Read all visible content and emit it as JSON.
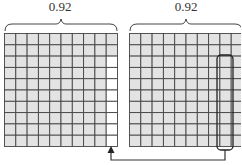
{
  "left_panel": {
    "label": "0.92",
    "rows": 10,
    "cols": 10,
    "white_cells_in_last_col": 8,
    "note": "92 of 100 cells shaded"
  },
  "right_panel": {
    "label": "0.92",
    "rows": 10,
    "cols": 10,
    "highlight": {
      "col": 9,
      "row_start": 3,
      "row_end": 10
    }
  },
  "colors": {
    "cell_fill": "#e3e3e3",
    "grid_line": "#444444",
    "empty_cell": "#ffffff",
    "arrow": "#333333"
  }
}
